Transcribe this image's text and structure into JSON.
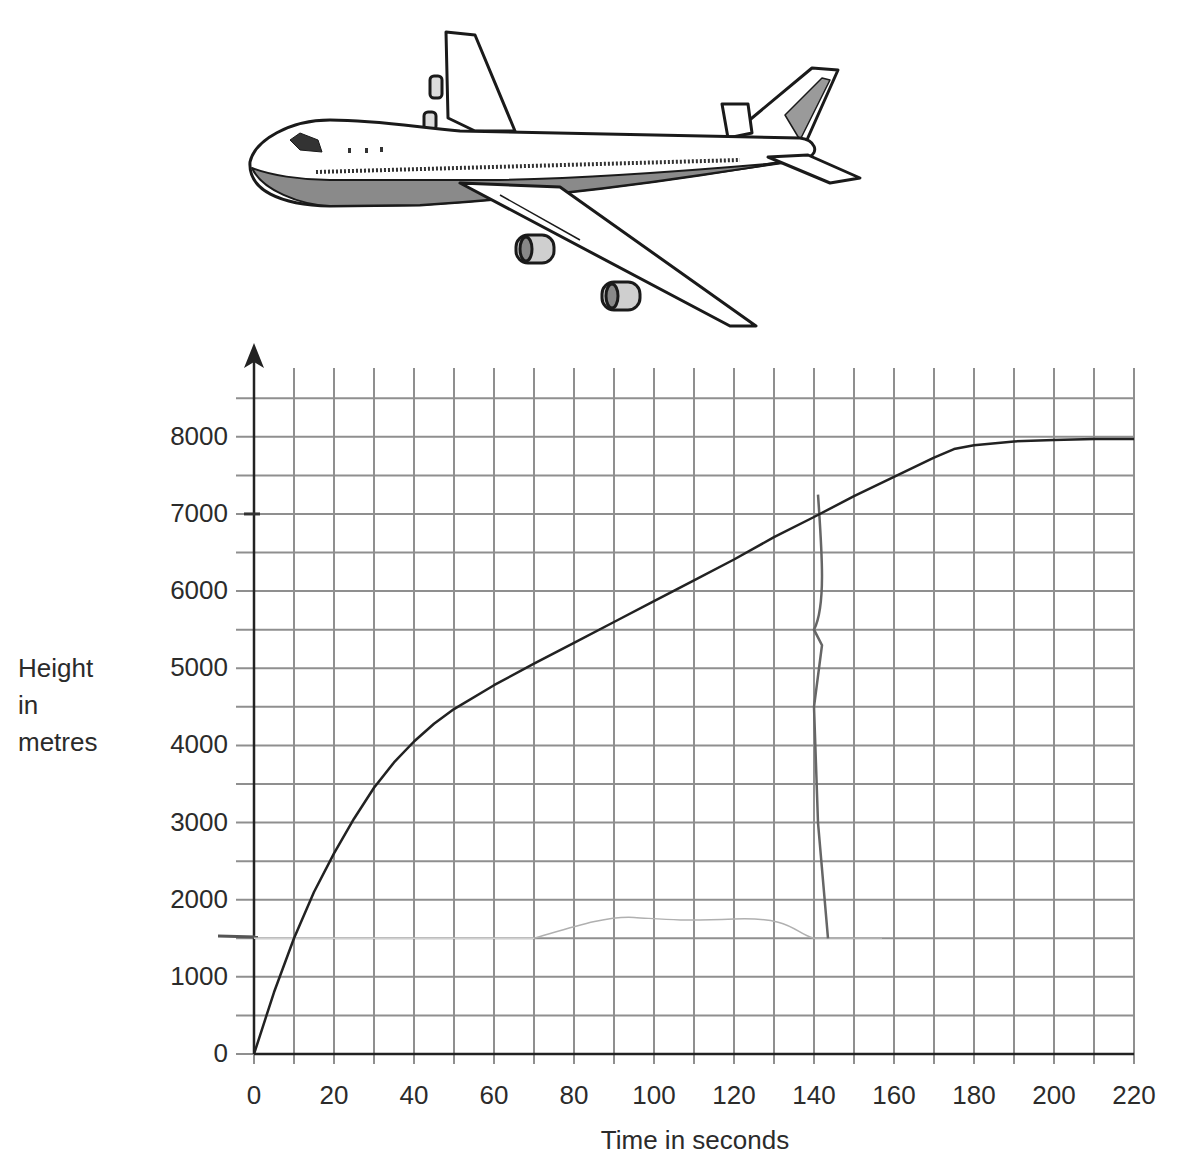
{
  "chart_data": {
    "type": "line",
    "title": "",
    "xlabel": "Time in seconds",
    "ylabel": "Height in metres",
    "ylabel_lines": [
      "Height",
      "in",
      "metres"
    ],
    "xlim": [
      0,
      220
    ],
    "ylim": [
      0,
      8500
    ],
    "x_ticks": [
      "0",
      "20",
      "40",
      "60",
      "80",
      "100",
      "120",
      "140",
      "160",
      "180",
      "200",
      "220"
    ],
    "y_ticks": [
      "0",
      "1000",
      "2000",
      "3000",
      "4000",
      "5000",
      "6000",
      "7000",
      "8000"
    ],
    "grid": true,
    "grid_minor_x_step": 10,
    "grid_minor_y_step": 500,
    "legend": null,
    "series": [
      {
        "name": "Aeroplane height",
        "color": "#222222",
        "x": [
          0,
          5,
          10,
          15,
          20,
          25,
          30,
          35,
          40,
          45,
          50,
          60,
          70,
          80,
          90,
          100,
          110,
          120,
          130,
          140,
          150,
          160,
          170,
          175,
          180,
          190,
          200,
          210,
          220
        ],
        "y": [
          0,
          800,
          1500,
          2100,
          2600,
          3050,
          3450,
          3780,
          4050,
          4280,
          4470,
          4780,
          5060,
          5330,
          5600,
          5870,
          6140,
          6410,
          6700,
          6960,
          7230,
          7480,
          7730,
          7840,
          7890,
          7940,
          7960,
          7970,
          7970
        ]
      }
    ],
    "annotations": [
      {
        "type": "pencil-mark",
        "description": "faint hand-drawn lines near 1500 m and a vertical line at about 140 s"
      }
    ]
  },
  "illustration": {
    "name": "airliner-illustration"
  }
}
